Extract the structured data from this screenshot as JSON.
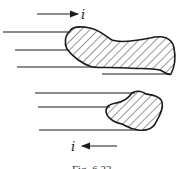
{
  "figure": {
    "caption": "Fig. 6.33",
    "top_current_label": "i",
    "bottom_current_label": "i",
    "top_current_direction": "right",
    "bottom_current_direction": "left"
  },
  "colors": {
    "ink": "#1a1a1a",
    "background": "#ffffff"
  }
}
